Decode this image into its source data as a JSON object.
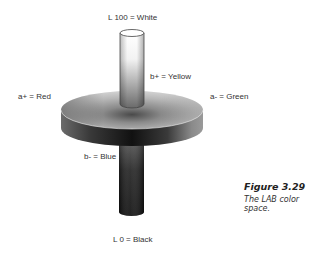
{
  "figure": {
    "title": "Figure 3.29",
    "caption": "The LAB color space."
  },
  "labels": {
    "l_top": "L 100 = White",
    "b_plus": "b+ = Yellow",
    "a_plus": "a+ = Red",
    "a_minus": "a- = Green",
    "b_minus": "b- = Blue",
    "l_bottom": "L 0 = Black"
  },
  "colors": {
    "background": "#ffffff",
    "text": "#333333",
    "white_end": "#ffffff",
    "black_end": "#111111"
  }
}
